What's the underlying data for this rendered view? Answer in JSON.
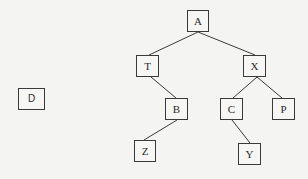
{
  "diagram": {
    "type": "binary-tree",
    "nodes": [
      {
        "id": "A",
        "label": "A",
        "x": 187,
        "y": 10,
        "w": 22,
        "h": 22
      },
      {
        "id": "T",
        "label": "T",
        "x": 136,
        "y": 55,
        "w": 23,
        "h": 22
      },
      {
        "id": "X",
        "label": "X",
        "x": 243,
        "y": 55,
        "w": 23,
        "h": 22
      },
      {
        "id": "B",
        "label": "B",
        "x": 165,
        "y": 98,
        "w": 23,
        "h": 22
      },
      {
        "id": "C",
        "label": "C",
        "x": 220,
        "y": 98,
        "w": 23,
        "h": 22
      },
      {
        "id": "P",
        "label": "P",
        "x": 272,
        "y": 98,
        "w": 23,
        "h": 22
      },
      {
        "id": "Z",
        "label": "Z",
        "x": 134,
        "y": 140,
        "w": 22,
        "h": 22
      },
      {
        "id": "Y",
        "label": "Y",
        "x": 238,
        "y": 143,
        "w": 23,
        "h": 22
      },
      {
        "id": "D",
        "label": "D",
        "x": 18,
        "y": 88,
        "w": 27,
        "h": 22
      }
    ],
    "edges": [
      {
        "from": "A",
        "to": "T"
      },
      {
        "from": "A",
        "to": "X"
      },
      {
        "from": "T",
        "to": "B"
      },
      {
        "from": "X",
        "to": "C"
      },
      {
        "from": "X",
        "to": "P"
      },
      {
        "from": "B",
        "to": "Z"
      },
      {
        "from": "C",
        "to": "Y"
      }
    ],
    "colors": {
      "background": "#f4f4f3",
      "stroke": "#3a3a3a",
      "text": "#2a2a2a"
    }
  }
}
